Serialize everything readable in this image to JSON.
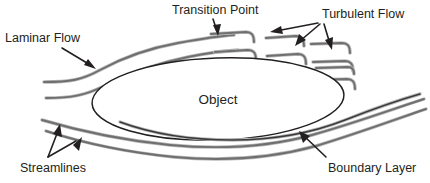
{
  "figure": {
    "background_color": "#ffffff",
    "width": 430,
    "height": 183
  },
  "colors": {
    "text": "#231f20",
    "streamline": "#6f6f6f",
    "streamline_halo": "#b9b9b9",
    "object_outline": "#231f20",
    "boundary_layer": "#3a3a3a",
    "arrow": "#231f20"
  },
  "labels": {
    "laminar_flow": "Laminar Flow",
    "transition_point": "Transition Point",
    "turbulent_flow": "Turbulent Flow",
    "object": "Object",
    "streamlines": "Streamlines",
    "boundary_layer": "Boundary Layer"
  },
  "annotations": [
    {
      "id": "laminar-flow",
      "label": "Laminar Flow",
      "text_x": 5,
      "text_y": 42,
      "arrow_count": 1,
      "points_to": "upper smooth streamline upstream of object"
    },
    {
      "id": "transition-point",
      "label": "Transition Point",
      "text_x": 172,
      "text_y": 14,
      "arrow_count": 1,
      "points_to": "break in upper streamline where dashes begin"
    },
    {
      "id": "turbulent-flow",
      "label": "Turbulent Flow",
      "text_x": 322,
      "text_y": 18,
      "arrow_count": 3,
      "points_to": "broken hooked eddies downstream of transition"
    },
    {
      "id": "streamlines",
      "label": "Streamlines",
      "text_x": 20,
      "text_y": 172,
      "arrow_count": 2,
      "points_to": "two lower flow lines beneath object"
    },
    {
      "id": "boundary-layer",
      "label": "Boundary Layer",
      "text_x": 328,
      "text_y": 172,
      "arrow_count": 1,
      "points_to": "thin dark line hugging lower surface of object"
    }
  ],
  "object_shape": {
    "label": "Object",
    "type": "ellipse",
    "center_x": 218,
    "center_y": 99,
    "radius_x": 126,
    "radius_y": 41,
    "rotation_deg": -2,
    "label_x": 218,
    "label_y": 104
  },
  "flow": {
    "upper_laminar_segments": 2,
    "upper_turbulent_eddy_rows": 3,
    "upper_turbulent_eddy_count": 9,
    "lower_streamline_count": 2,
    "transition_x": 236,
    "direction": "left-to-right"
  }
}
